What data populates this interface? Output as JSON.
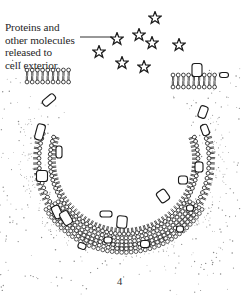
{
  "figure": {
    "annotation": {
      "lines": [
        "Proteins and",
        "other molecules",
        "released to",
        "cell exterior"
      ]
    },
    "page_number": "4",
    "colors": {
      "ink": "#1a1a1a",
      "background": "#ffffff",
      "stipple": "#555555"
    },
    "icons": {
      "released_molecule": "star-icon",
      "lipid": "phospholipid-icon",
      "membrane_protein": "protein-blob-icon"
    }
  }
}
